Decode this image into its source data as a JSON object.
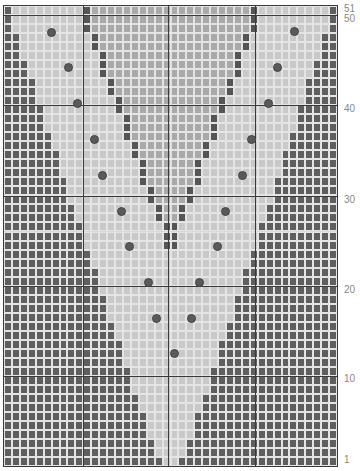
{
  "chart": {
    "columns": 42,
    "rows": 51,
    "cell_width": 7.93,
    "cell_height": 9.02,
    "colors": {
      "background_dark": "#5f5f5f",
      "outer_v_light": "#c9c9c9",
      "inner_v_mid": "#a9a9a9",
      "inner_outline_dark": "#555555",
      "grid_line": "#e4e4e4",
      "dot": "#5a5a5a"
    },
    "pattern": {
      "outer_edge_start_cols": 1,
      "outer_edge_slope": 0.38,
      "inner_left_start_col": 11,
      "inner_right_start_col": 32,
      "inner_slope": 0.42
    },
    "thick_vertical_lines_px": [
      82,
      167,
      254
    ],
    "thick_horizontal_lines_px": [
      14,
      104,
      195,
      285,
      375
    ],
    "dots": [
      {
        "x": 50,
        "y": 31
      },
      {
        "x": 67,
        "y": 66
      },
      {
        "x": 76,
        "y": 102
      },
      {
        "x": 93,
        "y": 138
      },
      {
        "x": 101,
        "y": 174
      },
      {
        "x": 120,
        "y": 210
      },
      {
        "x": 128,
        "y": 245
      },
      {
        "x": 147,
        "y": 281
      },
      {
        "x": 155,
        "y": 317
      },
      {
        "x": 173,
        "y": 352
      },
      {
        "x": 293,
        "y": 30
      },
      {
        "x": 276,
        "y": 66
      },
      {
        "x": 267,
        "y": 102
      },
      {
        "x": 250,
        "y": 138
      },
      {
        "x": 241,
        "y": 174
      },
      {
        "x": 224,
        "y": 210
      },
      {
        "x": 216,
        "y": 245
      },
      {
        "x": 198,
        "y": 281
      },
      {
        "x": 190,
        "y": 317
      }
    ]
  },
  "row_labels": [
    {
      "text": "51",
      "y": 4
    },
    {
      "text": "50",
      "y": 14
    },
    {
      "text": "40",
      "y": 104
    },
    {
      "text": "30",
      "y": 195
    },
    {
      "text": "20",
      "y": 285
    },
    {
      "text": "10",
      "y": 374
    },
    {
      "text": "1",
      "y": 455
    }
  ]
}
